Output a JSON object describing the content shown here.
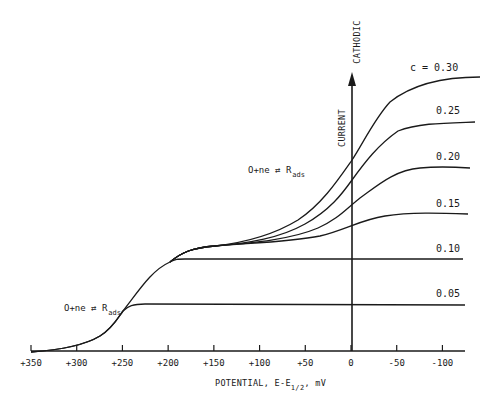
{
  "chart_data": {
    "type": "line",
    "title": "",
    "xlabel": "POTENTIAL, E-E1/2, mV",
    "xlabel_parts": {
      "main": "POTENTIAL, E-E",
      "sub": "1/2",
      "tail": ", mV"
    },
    "ylabel": "CURRENT",
    "ylabel_direction": "CATHODIC",
    "x_ticks": [
      "+350",
      "+300",
      "+250",
      "+200",
      "+150",
      "+100",
      "+50",
      "0",
      "-50",
      "-100"
    ],
    "x_tick_values": [
      350,
      300,
      250,
      200,
      150,
      100,
      50,
      0,
      -50,
      -100
    ],
    "xlim": [
      355,
      -125
    ],
    "ylim": [
      0,
      1
    ],
    "grid": false,
    "legend": "inline labels",
    "annotations": [
      {
        "text": "O+ne ⇄ R",
        "sub": "ads",
        "near_x": 245,
        "note": "lower adsorption wave"
      },
      {
        "text": "O+ne ⇄ R",
        "sub": "ads",
        "near_x": 100,
        "note": "upper (solution) wave"
      }
    ],
    "series": [
      {
        "name": "c = 0.05",
        "label": "0.05",
        "x": [
          350,
          300,
          270,
          250,
          240,
          230,
          200,
          100,
          0,
          -125
        ],
        "y": [
          0.0,
          0.05,
          0.12,
          0.18,
          0.215,
          0.225,
          0.225,
          0.225,
          0.225,
          0.225
        ]
      },
      {
        "name": "c = 0.10",
        "label": "0.10",
        "x": [
          350,
          300,
          250,
          220,
          200,
          190,
          150,
          100,
          0,
          -125
        ],
        "y": [
          0.0,
          0.05,
          0.18,
          0.32,
          0.39,
          0.41,
          0.41,
          0.41,
          0.41,
          0.41
        ]
      },
      {
        "name": "c = 0.15",
        "label": "0.15",
        "x": [
          350,
          250,
          200,
          175,
          150,
          100,
          50,
          0,
          -50,
          -100,
          -125
        ],
        "y": [
          0.0,
          0.18,
          0.39,
          0.44,
          0.45,
          0.46,
          0.47,
          0.5,
          0.54,
          0.55,
          0.55
        ]
      },
      {
        "name": "c = 0.20",
        "label": "0.20",
        "x": [
          350,
          250,
          200,
          175,
          150,
          100,
          50,
          0,
          -50,
          -100,
          -125
        ],
        "y": [
          0.0,
          0.18,
          0.39,
          0.44,
          0.45,
          0.46,
          0.5,
          0.59,
          0.68,
          0.7,
          0.7
        ]
      },
      {
        "name": "c = 0.25",
        "label": "0.25",
        "x": [
          350,
          250,
          200,
          175,
          150,
          100,
          50,
          0,
          -50,
          -100,
          -125
        ],
        "y": [
          0.0,
          0.18,
          0.39,
          0.44,
          0.45,
          0.465,
          0.52,
          0.67,
          0.8,
          0.84,
          0.845
        ]
      },
      {
        "name": "c = 0.30",
        "label": "c = 0.30",
        "x": [
          350,
          250,
          200,
          175,
          150,
          100,
          50,
          0,
          -50,
          -100,
          -125
        ],
        "y": [
          0.0,
          0.18,
          0.39,
          0.44,
          0.45,
          0.47,
          0.55,
          0.75,
          0.92,
          0.96,
          0.965
        ]
      }
    ]
  }
}
